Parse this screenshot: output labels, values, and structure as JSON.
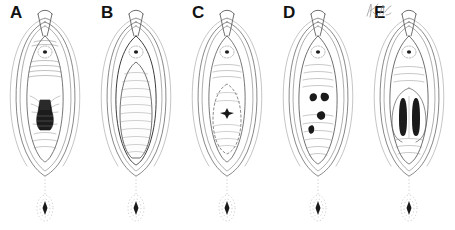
{
  "figure": {
    "panel_count": 5,
    "background_color": "#ffffff",
    "ink_color": "#4a4a4a",
    "dark_fill_color": "#1a1a1a",
    "label_color": "#121212",
    "artist_signature_present": true,
    "artist_signature_text": "",
    "artist_signature_legible": "illegible handwritten mark, lower right of panel E"
  },
  "panels": [
    {
      "label": "A",
      "x": 0,
      "center_feature": "dark rounded cone-shaped mass with horizontal banding, lower-middle",
      "feature_kind": "cone-mass",
      "feature_count": 1
    },
    {
      "label": "B",
      "x": 91,
      "center_feature": "large smooth pale oval filling the interior, fine horizontal hatching",
      "feature_kind": "large-oval",
      "feature_count": 1
    },
    {
      "label": "C",
      "x": 182,
      "center_feature": "inner oval outline with one small dark star-shaped spot at its center",
      "feature_kind": "single-spot",
      "feature_count": 1
    },
    {
      "label": "D",
      "x": 273,
      "center_feature": "four small dark irregular blobs scattered in a loose diagonal",
      "feature_kind": "multi-spot",
      "feature_count": 4
    },
    {
      "label": "E",
      "x": 364,
      "center_feature": "two symmetric elongated dark vertical lobes side by side",
      "feature_kind": "paired-lobes",
      "feature_count": 2
    }
  ],
  "common_elements": {
    "top": "narrow vertical cleft with hood, small circular feature below",
    "outline": "concentric almond / teardrop contours",
    "bottom": "small oval with dark diamond center, joined by faint dotted midline"
  }
}
